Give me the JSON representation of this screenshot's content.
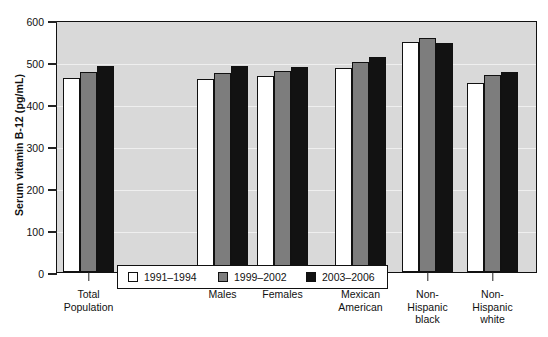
{
  "chart_data": {
    "type": "bar",
    "title": "",
    "xlabel": "",
    "ylabel": "Serum vitamin B-12 (pg/mL)",
    "ylim": [
      0,
      600
    ],
    "yticks": [
      0,
      100,
      200,
      300,
      400,
      500,
      600
    ],
    "ytick_labels": [
      "0",
      "100",
      "200",
      "300",
      "400",
      "500",
      "600"
    ],
    "grid": true,
    "legend_position": "lower-left-inside",
    "categories": [
      "Total\nPopulation",
      "Males",
      "Females",
      "Mexican\nAmerican",
      "Non-\nHispanic\nblack",
      "Non-\nHispanic\nwhite"
    ],
    "category_lines": [
      [
        "Total",
        "Population"
      ],
      [
        "Males"
      ],
      [
        "Females"
      ],
      [
        "Mexican",
        "American"
      ],
      [
        "Non-",
        "Hispanic",
        "black"
      ],
      [
        "Non-",
        "Hispanic",
        "white"
      ]
    ],
    "series": [
      {
        "name": "1991–1994",
        "color": "#ffffff",
        "values": [
          463,
          459,
          466,
          485,
          548,
          450
        ]
      },
      {
        "name": "1999–2002",
        "color": "#7d7d7d",
        "values": [
          476,
          474,
          479,
          500,
          556,
          470
        ]
      },
      {
        "name": "2003–2006",
        "color": "#121212",
        "values": [
          490,
          490,
          488,
          513,
          546,
          476
        ]
      }
    ]
  },
  "legend": {
    "items": [
      {
        "label": "1991–1994",
        "swatch": "white-square-icon"
      },
      {
        "label": "1999–2002",
        "swatch": "gray-square-icon"
      },
      {
        "label": "2003–2006",
        "swatch": "black-square-icon"
      }
    ]
  },
  "colors": {
    "plot_background": "#d9d9d9",
    "gridline": "#efefef",
    "axis": "#111111",
    "series_1": "#ffffff",
    "series_2": "#7d7d7d",
    "series_3": "#121212"
  }
}
